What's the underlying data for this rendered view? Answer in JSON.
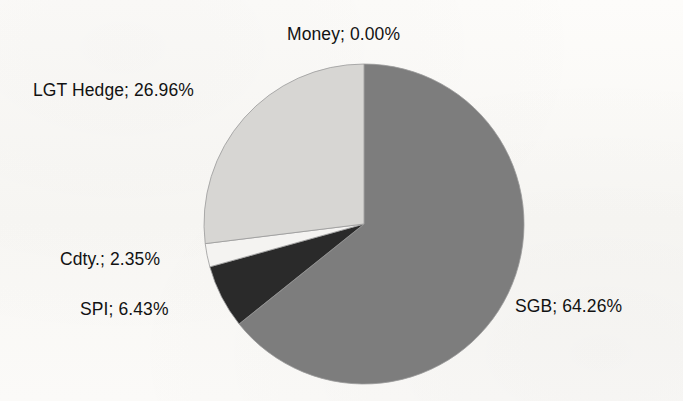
{
  "chart_data": {
    "type": "pie",
    "title": "",
    "subtitle": "",
    "xlabel": "",
    "ylabel": "",
    "legend_position": "none",
    "grid": false,
    "label_format": "name; value%",
    "start_angle_deg": 0,
    "direction": "clockwise",
    "categories": [
      "SGB",
      "SPI",
      "Cdty.",
      "LGT Hedge",
      "Money"
    ],
    "values": [
      64.26,
      6.43,
      2.35,
      26.96,
      0.0
    ],
    "total": 100.0,
    "slices": [
      {
        "name": "SGB",
        "value": 64.26,
        "value_text": "64.26",
        "label": "SGB; 64.26%",
        "color": "#7d7d7d",
        "start_deg": 0.0,
        "end_deg": 231.336
      },
      {
        "name": "SPI",
        "value": 6.43,
        "value_text": "6.43",
        "label": "SPI; 6.43%",
        "color": "#2b2b2b",
        "start_deg": 231.336,
        "end_deg": 254.484
      },
      {
        "name": "Cdty.",
        "value": 2.35,
        "value_text": "2.35",
        "label": "Cdty.; 2.35%",
        "color": "#f4f3f1",
        "start_deg": 254.484,
        "end_deg": 262.944
      },
      {
        "name": "LGT Hedge",
        "value": 26.96,
        "value_text": "26.96",
        "label": "LGT Hedge; 26.96%",
        "color": "#d7d6d3",
        "start_deg": 262.944,
        "end_deg": 360.0
      },
      {
        "name": "Money",
        "value": 0.0,
        "value_text": "0.00",
        "label": "Money; 0.00%",
        "color": "#9a9a9a",
        "start_deg": 360.0,
        "end_deg": 360.0
      }
    ],
    "geometry": {
      "center_x": 364,
      "center_y": 224,
      "radius_x": 160,
      "radius_y": 160
    },
    "colors": {
      "background": "#fbfaf8",
      "text": "#121212",
      "sgb": "#7d7d7d",
      "spi": "#2b2b2b",
      "cdty": "#f4f3f1",
      "lgt_hedge": "#d7d6d3",
      "outline": "#9a9a9a"
    }
  },
  "labels": {
    "money": "Money; 0.00%",
    "lgt_hedge": "LGT Hedge; 26.96%",
    "cdty": "Cdty.; 2.35%",
    "spi": "SPI; 6.43%",
    "sgb": "SGB; 64.26%"
  }
}
